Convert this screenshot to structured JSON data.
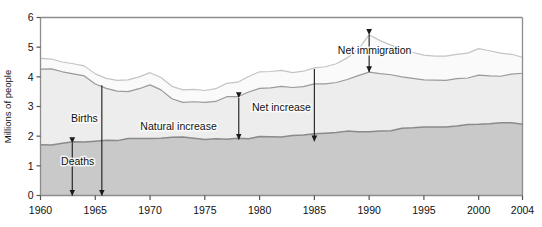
{
  "chart_data": {
    "type": "area",
    "stacked": true,
    "title": "",
    "subtitle": "",
    "xlabel": "",
    "ylabel": "Millions of people",
    "xlim": [
      1960,
      2004
    ],
    "ylim": [
      0,
      6
    ],
    "yticks": [
      0,
      1,
      2,
      3,
      4,
      5,
      6
    ],
    "xticks": [
      1960,
      1965,
      1970,
      1975,
      1980,
      1985,
      1990,
      1995,
      2000,
      2004
    ],
    "grid": false,
    "legend_position": "none",
    "x": [
      1960,
      1961,
      1962,
      1963,
      1964,
      1965,
      1966,
      1967,
      1968,
      1969,
      1970,
      1971,
      1972,
      1973,
      1974,
      1975,
      1976,
      1977,
      1978,
      1979,
      1980,
      1981,
      1982,
      1983,
      1984,
      1985,
      1986,
      1987,
      1988,
      1989,
      1990,
      1991,
      1992,
      1993,
      1994,
      1995,
      1996,
      1997,
      1998,
      1999,
      2000,
      2001,
      2002,
      2003,
      2004
    ],
    "series": [
      {
        "name": "Deaths",
        "fill": "#c9c9c9",
        "line": "#8a8a8a",
        "values": [
          1.71,
          1.7,
          1.76,
          1.81,
          1.8,
          1.83,
          1.86,
          1.85,
          1.92,
          1.92,
          1.92,
          1.93,
          1.96,
          1.97,
          1.93,
          1.89,
          1.91,
          1.9,
          1.93,
          1.91,
          1.99,
          1.98,
          1.97,
          2.02,
          2.04,
          2.08,
          2.1,
          2.12,
          2.17,
          2.15,
          2.15,
          2.17,
          2.18,
          2.27,
          2.28,
          2.31,
          2.31,
          2.31,
          2.34,
          2.39,
          2.4,
          2.42,
          2.45,
          2.45,
          2.4
        ]
      },
      {
        "name": "Births",
        "fill": "#ededed",
        "line": "#9a9a9a",
        "values": [
          4.26,
          4.27,
          4.17,
          4.1,
          4.03,
          3.76,
          3.61,
          3.52,
          3.5,
          3.6,
          3.73,
          3.56,
          3.26,
          3.14,
          3.16,
          3.14,
          3.17,
          3.33,
          3.33,
          3.49,
          3.61,
          3.63,
          3.68,
          3.64,
          3.67,
          3.76,
          3.76,
          3.81,
          3.91,
          4.04,
          4.16,
          4.11,
          4.07,
          4.0,
          3.95,
          3.9,
          3.89,
          3.88,
          3.94,
          3.96,
          4.06,
          4.03,
          4.02,
          4.09,
          4.12
        ]
      },
      {
        "name": "Net immigration",
        "fill": "#fafafa",
        "line": "#c4c4c4",
        "values": [
          4.62,
          4.6,
          4.5,
          4.44,
          4.37,
          4.1,
          3.95,
          3.88,
          3.9,
          4.0,
          4.14,
          3.98,
          3.68,
          3.56,
          3.58,
          3.54,
          3.6,
          3.78,
          3.82,
          4.01,
          4.17,
          4.18,
          4.22,
          4.14,
          4.19,
          4.3,
          4.34,
          4.44,
          4.64,
          4.92,
          5.42,
          5.22,
          5.07,
          4.92,
          4.82,
          4.73,
          4.7,
          4.7,
          4.76,
          4.8,
          4.95,
          4.88,
          4.8,
          4.76,
          4.66
        ]
      }
    ],
    "annotations": [
      {
        "id": "deaths",
        "label": "Deaths",
        "from_value": 1.77,
        "to_value": 0.0,
        "year": 1962.9,
        "label_year": 1963.4,
        "label_value": 1.02,
        "double_headed": true
      },
      {
        "id": "births",
        "label": "Births",
        "from_value": 3.72,
        "to_value": 0.0,
        "year": 1965.6,
        "label_year": 1964.0,
        "label_value": 2.47,
        "double_headed": false
      },
      {
        "id": "natural-increase",
        "label": "Natural increase",
        "from_value": 3.29,
        "to_value": 1.89,
        "year": 1978.1,
        "label_year": 1972.6,
        "label_value": 2.22,
        "double_headed": true
      },
      {
        "id": "net-increase",
        "label": "Net increase",
        "from_value": 4.26,
        "to_value": 1.83,
        "year": 1985.0,
        "label_year": 1982.0,
        "label_value": 2.86,
        "double_headed": false
      },
      {
        "id": "net-immigration",
        "label": "Net immigration",
        "from_value": 5.42,
        "to_value": 4.16,
        "year": 1990.0,
        "label_year": 1990.5,
        "label_value": 4.76,
        "double_headed": true
      }
    ]
  }
}
